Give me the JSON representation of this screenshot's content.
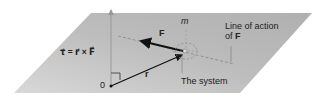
{
  "diagram": {
    "equation": "τ⃗ = r⃗ × F⃗",
    "equation_parts": {
      "lhs": "τ",
      "eq": "=",
      "r": "r",
      "times": "×",
      "F": "F"
    },
    "force_label": "F",
    "mass_label": "m",
    "line_of_action_label_1": "Line of action",
    "line_of_action_label_2": "of",
    "line_of_action_F": "F",
    "position_label": "r",
    "system_label": "The system",
    "origin_label": "0",
    "colors": {
      "plane": "#b8b8b8",
      "plane_light": "#d9d9d9",
      "vector": "#111111",
      "dashed": "#888888"
    }
  }
}
